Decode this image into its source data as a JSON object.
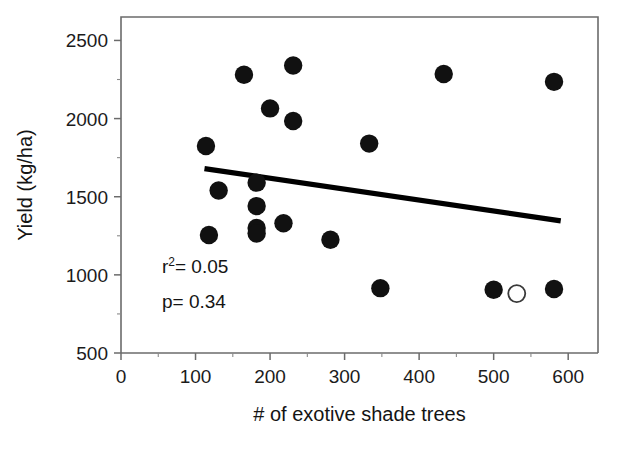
{
  "chart_data": {
    "type": "scatter",
    "title": "",
    "xlabel": "# of exotive shade trees",
    "ylabel": "Yield (kg/ha)",
    "xlim": [
      0,
      640
    ],
    "ylim": [
      500,
      2650
    ],
    "xticks": [
      0,
      100,
      200,
      300,
      400,
      500,
      600
    ],
    "xticklabels": [
      "0",
      "100",
      "200",
      "300",
      "400",
      "500",
      "600"
    ],
    "yticks": [
      500,
      1000,
      1500,
      2000,
      2500
    ],
    "yticklabels": [
      "500",
      "1000",
      "1500",
      "2000",
      "2500"
    ],
    "grid": false,
    "legend": null,
    "series": [
      {
        "name": "filled",
        "marker": "filled-circle",
        "color": "#111111",
        "points": [
          {
            "x": 114,
            "y": 1825
          },
          {
            "x": 118,
            "y": 1255
          },
          {
            "x": 131,
            "y": 1540
          },
          {
            "x": 165,
            "y": 2280
          },
          {
            "x": 182,
            "y": 1590
          },
          {
            "x": 182,
            "y": 1440
          },
          {
            "x": 182,
            "y": 1300
          },
          {
            "x": 182,
            "y": 1265
          },
          {
            "x": 200,
            "y": 2065
          },
          {
            "x": 218,
            "y": 1330
          },
          {
            "x": 231,
            "y": 2340
          },
          {
            "x": 231,
            "y": 1985
          },
          {
            "x": 281,
            "y": 1225
          },
          {
            "x": 333,
            "y": 1840
          },
          {
            "x": 348,
            "y": 915
          },
          {
            "x": 433,
            "y": 2285
          },
          {
            "x": 500,
            "y": 905
          },
          {
            "x": 581,
            "y": 2235
          },
          {
            "x": 581,
            "y": 910
          }
        ]
      },
      {
        "name": "open",
        "marker": "open-circle",
        "color": "#ffffff",
        "points": [
          {
            "x": 531,
            "y": 880
          }
        ]
      }
    ],
    "trendline": {
      "x_start": 112,
      "y_start": 1680,
      "x_end": 590,
      "y_end": 1345
    },
    "annotations": [
      {
        "id": "r2",
        "text_prefix": "r",
        "text_sup": "2",
        "text_suffix": "= 0.05",
        "x": 55,
        "y": 1010
      },
      {
        "id": "pvalue",
        "text_prefix": "p",
        "text_sup": "",
        "text_suffix": "= 0.34",
        "x": 55,
        "y": 790
      }
    ]
  },
  "labels": {
    "r2_prefix": "r",
    "r2_superscript": "2",
    "r2_value": "= 0.05",
    "p_text": "p= 0.34"
  },
  "colors": {
    "marker_fill": "#111111",
    "marker_open_stroke": "#3a3a3a",
    "trendline": "#000000",
    "axis": "#6b6b6b",
    "text": "#141414",
    "background": "#ffffff"
  }
}
